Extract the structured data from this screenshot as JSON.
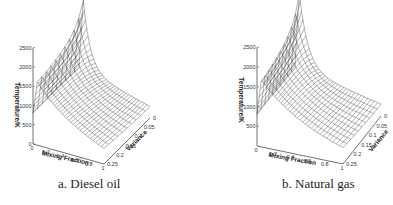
{
  "figure": {
    "panels": [
      {
        "id": "a",
        "caption": "a. Diesel oil",
        "z_label": "Temperature/K",
        "x_label": "Mixing Fraction",
        "y_label": "Variance",
        "z_ticks": [
          "0",
          "500",
          "1000",
          "1500",
          "2000",
          "2500"
        ],
        "x_ticks": [
          "0",
          "0.2",
          "0.4",
          "0.6",
          "0.8",
          "1"
        ],
        "y_ticks": [
          "0",
          "0.05",
          "0.1",
          "0.15",
          "0.2",
          "0.25"
        ]
      },
      {
        "id": "b",
        "caption": "b. Natural gas",
        "z_label": "Temperature/K",
        "x_label": "Mixing Fraction",
        "y_label": "Variance",
        "z_ticks": [
          "500",
          "1000",
          "1500",
          "2000",
          "2500"
        ],
        "x_ticks": [
          "0",
          "0.2",
          "0.4",
          "0.6",
          "0.8",
          "1"
        ],
        "y_ticks": [
          "0",
          "0.05",
          "0.1",
          "0.15",
          "0.2",
          "0.25"
        ]
      }
    ]
  },
  "chart_data": [
    {
      "type": "surface",
      "title": "a. Diesel oil",
      "xlabel": "Mixing Fraction",
      "ylabel": "Variance",
      "zlabel": "Temperature/K",
      "xlim": [
        0,
        1
      ],
      "ylim": [
        0,
        0.25
      ],
      "zlim": [
        0,
        2500
      ],
      "peak": {
        "x": 0.06,
        "y": 0,
        "z": 2600
      },
      "boundary_values": {
        "x0_temperature": 800,
        "x1_temperature": 300
      }
    },
    {
      "type": "surface",
      "title": "b. Natural gas",
      "xlabel": "Mixing Fraction",
      "ylabel": "Variance",
      "zlabel": "Temperature/K",
      "xlim": [
        0,
        1
      ],
      "ylim": [
        0,
        0.25
      ],
      "zlim": [
        500,
        2500
      ],
      "peak": {
        "x": 0.05,
        "y": 0,
        "z": 2700
      },
      "boundary_values": {
        "x0_temperature": 800,
        "x1_temperature": 300
      }
    }
  ]
}
